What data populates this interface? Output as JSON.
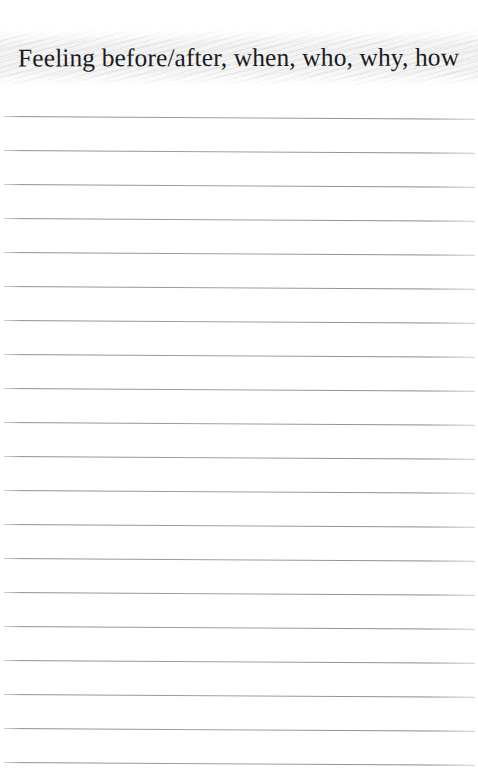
{
  "document": {
    "type": "lined-journal-page",
    "background_color": "#ffffff",
    "page_width": 478,
    "page_height": 779
  },
  "heading": {
    "text": "Feeling before/after, when, who, why, how",
    "color": "#1b1b1d",
    "alignment": "center"
  },
  "texture": {
    "name": "scanned-paper-band",
    "color": "#f3f3f4"
  },
  "ruled_lines": {
    "count": 20,
    "color": "#8e8e93",
    "spacing_px": 34,
    "first_line_y": 116,
    "left_margin_px": 4,
    "right_margin_px": 3,
    "skew_degrees": 0.34,
    "y_positions": [
      116,
      150,
      184,
      218,
      252,
      286,
      320,
      354,
      388,
      422,
      456,
      490,
      524,
      558,
      592,
      626,
      660,
      694,
      728,
      762
    ]
  }
}
